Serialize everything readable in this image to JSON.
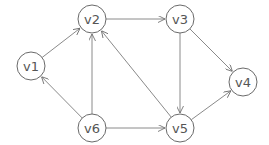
{
  "diagram": {
    "type": "directed-graph",
    "colors": {
      "stroke": "#6a6a6a",
      "edge": "#8a8a8a",
      "label": "#555555",
      "background": "#ffffff"
    },
    "node_radius": 14,
    "nodes": [
      {
        "id": "v1",
        "label": "v1",
        "x": 31,
        "y": 66
      },
      {
        "id": "v2",
        "label": "v2",
        "x": 92,
        "y": 19
      },
      {
        "id": "v3",
        "label": "v3",
        "x": 180,
        "y": 19
      },
      {
        "id": "v4",
        "label": "v4",
        "x": 243,
        "y": 82
      },
      {
        "id": "v5",
        "label": "v5",
        "x": 180,
        "y": 128
      },
      {
        "id": "v6",
        "label": "v6",
        "x": 92,
        "y": 128
      }
    ],
    "edges": [
      {
        "from": "v1",
        "to": "v2"
      },
      {
        "from": "v6",
        "to": "v1"
      },
      {
        "from": "v6",
        "to": "v2"
      },
      {
        "from": "v5",
        "to": "v2"
      },
      {
        "from": "v2",
        "to": "v3"
      },
      {
        "from": "v3",
        "to": "v5"
      },
      {
        "from": "v3",
        "to": "v4"
      },
      {
        "from": "v6",
        "to": "v5"
      },
      {
        "from": "v5",
        "to": "v4"
      }
    ]
  }
}
